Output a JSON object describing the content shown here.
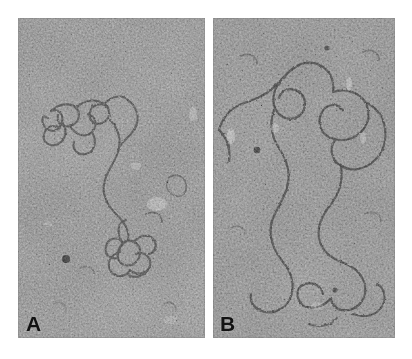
{
  "figure": {
    "kind": "electron-micrograph-figure",
    "panel_count": 2,
    "background_color": "#ffffff",
    "width": 412,
    "height": 359
  },
  "panels": [
    {
      "id": "A",
      "label": "A",
      "name": "panel-a",
      "x": 18,
      "y": 18,
      "width": 187,
      "height": 320,
      "content": "electron micrograph of a negatively stained grain background with a tangled, partially supercoiled DNA molecule running from upper-left to lower-centre",
      "base_color": "#8f8f8f",
      "grain_dark": "#3a3a3a",
      "grain_light": "#c8c8c8",
      "filament_color": "#4a4a4a",
      "features": [
        "branched condensed DNA tangle at upper left",
        "long single filament arc toward lower centre",
        "small rosette / supercoil knot near bottom centre",
        "isolated dark stain particle at lower left",
        "bright stain-thin patch at mid right"
      ]
    },
    {
      "id": "B",
      "label": "B",
      "name": "panel-b",
      "x": 213,
      "y": 18,
      "width": 182,
      "height": 320,
      "content": "electron micrograph of a negatively stained grain background with a relaxed open-circular DNA molecule forming large loops across the field",
      "base_color": "#8c8c8c",
      "grain_dark": "#343434",
      "grain_light": "#c4c4c4",
      "filament_color": "#3f3f3f",
      "features": [
        "large open loop across the upper half",
        "second large loop at upper right",
        "long meandering strand descending through the centre",
        "crossing strands near the bottom right",
        "small bright stain-thin streaks at left and upper right"
      ]
    }
  ],
  "labels": {
    "panel_a": "A",
    "panel_b": "B"
  },
  "colors": {
    "page_background": "#ffffff",
    "micrograph_mid_gray": "#8e8e8e",
    "label_text": "#121212"
  }
}
